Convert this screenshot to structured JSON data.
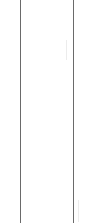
{
  "panel": {
    "background": "#ffffff",
    "border_color": "#6a6a6a",
    "columns": [
      {
        "name": "left-border",
        "x": 20
      },
      {
        "name": "right-border",
        "x": 73
      }
    ]
  }
}
